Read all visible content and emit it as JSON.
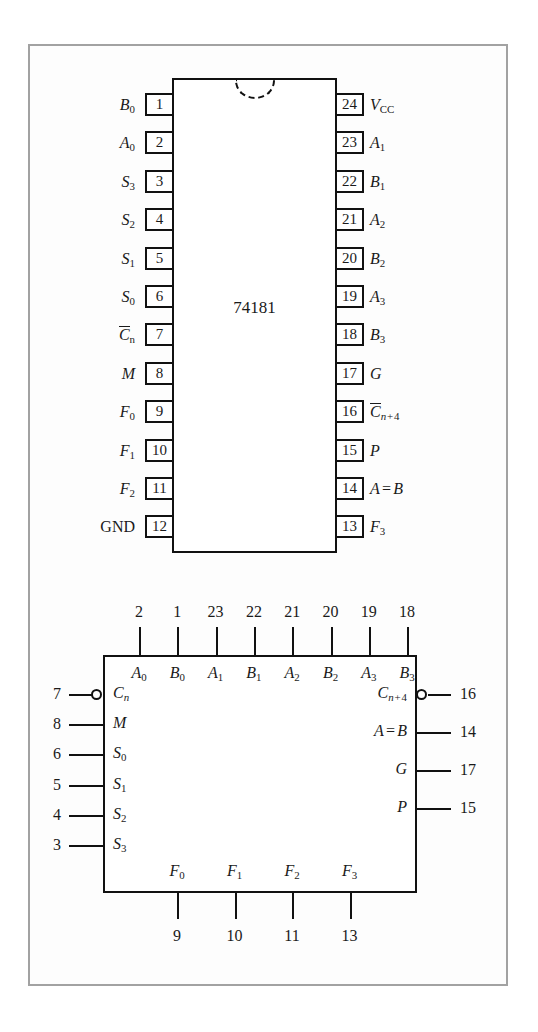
{
  "figure": {
    "chip_name": "74181",
    "frame_color": "#a2a2a2",
    "line_color": "#111111"
  },
  "dip": {
    "label": "74181",
    "notch": "dip-orientation-notch",
    "left_pins": [
      {
        "num": "1",
        "label_html": "B<span class='sub'>0</span>"
      },
      {
        "num": "2",
        "label_html": "A<span class='sub'>0</span>"
      },
      {
        "num": "3",
        "label_html": "S<span class='sub'>3</span>"
      },
      {
        "num": "4",
        "label_html": "S<span class='sub'>2</span>"
      },
      {
        "num": "5",
        "label_html": "S<span class='sub'>1</span>"
      },
      {
        "num": "6",
        "label_html": "S<span class='sub'>0</span>"
      },
      {
        "num": "7",
        "label_html": "<span class='ovl'>C</span><span class='sub'>n</span>"
      },
      {
        "num": "8",
        "label_html": "M"
      },
      {
        "num": "9",
        "label_html": "F<span class='sub'>0</span>"
      },
      {
        "num": "10",
        "label_html": "F<span class='sub'>1</span>"
      },
      {
        "num": "11",
        "label_html": "F<span class='sub'>2</span>"
      },
      {
        "num": "12",
        "label_html": "<span class='nm'>GND</span>"
      }
    ],
    "right_pins": [
      {
        "num": "24",
        "label_html": "V<span class='sub'>CC</span>"
      },
      {
        "num": "23",
        "label_html": "A<span class='sub'>1</span>"
      },
      {
        "num": "22",
        "label_html": "B<span class='sub'>1</span>"
      },
      {
        "num": "21",
        "label_html": "A<span class='sub'>2</span>"
      },
      {
        "num": "20",
        "label_html": "B<span class='sub'>2</span>"
      },
      {
        "num": "19",
        "label_html": "A<span class='sub'>3</span>"
      },
      {
        "num": "18",
        "label_html": "B<span class='sub'>3</span>"
      },
      {
        "num": "17",
        "label_html": "G"
      },
      {
        "num": "16",
        "label_html": "<span class='ovl'>C</span><span class='sub-i'>n</span><span class='sub'>&#8202;+&#8202;4</span>"
      },
      {
        "num": "15",
        "label_html": "P"
      },
      {
        "num": "14",
        "label_html": "A&#8202;=&#8202;B"
      },
      {
        "num": "13",
        "label_html": "F<span class='sub'>3</span>"
      }
    ]
  },
  "logic_symbol": {
    "top_ports": [
      {
        "pin": "2",
        "signal_html": "A<span class='sub'>0</span>"
      },
      {
        "pin": "1",
        "signal_html": "B<span class='sub'>0</span>"
      },
      {
        "pin": "23",
        "signal_html": "A<span class='sub'>1</span>"
      },
      {
        "pin": "22",
        "signal_html": "B<span class='sub'>1</span>"
      },
      {
        "pin": "21",
        "signal_html": "A<span class='sub'>2</span>"
      },
      {
        "pin": "20",
        "signal_html": "B<span class='sub'>2</span>"
      },
      {
        "pin": "19",
        "signal_html": "A<span class='sub'>3</span>"
      },
      {
        "pin": "18",
        "signal_html": "B<span class='sub'>3</span>"
      }
    ],
    "left_ports": [
      {
        "pin": "7",
        "signal_html": "C<span class='sub-i'>n</span>",
        "inverted": true
      },
      {
        "pin": "8",
        "signal_html": "M",
        "inverted": false
      },
      {
        "pin": "6",
        "signal_html": "S<span class='sub'>0</span>",
        "inverted": false
      },
      {
        "pin": "5",
        "signal_html": "S<span class='sub'>1</span>",
        "inverted": false
      },
      {
        "pin": "4",
        "signal_html": "S<span class='sub'>2</span>",
        "inverted": false
      },
      {
        "pin": "3",
        "signal_html": "S<span class='sub'>3</span>",
        "inverted": false
      }
    ],
    "right_ports": [
      {
        "pin": "16",
        "signal_html": "C<span class='sub-i'>n</span><span class='sub'>&#8202;+&#8202;4</span>",
        "inverted": true
      },
      {
        "pin": "14",
        "signal_html": "A&#8202;=&#8202;B",
        "inverted": false
      },
      {
        "pin": "17",
        "signal_html": "G",
        "inverted": false
      },
      {
        "pin": "15",
        "signal_html": "P",
        "inverted": false
      }
    ],
    "bottom_ports": [
      {
        "pin": "9",
        "signal_html": "F<span class='sub'>0</span>"
      },
      {
        "pin": "10",
        "signal_html": "F<span class='sub'>1</span>"
      },
      {
        "pin": "11",
        "signal_html": "F<span class='sub'>2</span>"
      },
      {
        "pin": "13",
        "signal_html": "F<span class='sub'>3</span>"
      }
    ]
  }
}
